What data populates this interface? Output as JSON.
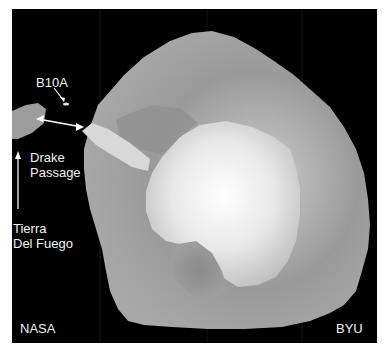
{
  "image": {
    "subject": "Satellite scatterometer image of Antarctica and surrounding sea ice",
    "colors": {
      "background": "#000000",
      "border": "#ffffff",
      "label": "#f2f2f2"
    }
  },
  "labels": {
    "iceberg": "B10A",
    "drake_line1": "Drake",
    "drake_line2": "Passage",
    "tierra_line1": "Tierra",
    "tierra_line2": "Del Fuego",
    "credit_left": "NASA",
    "credit_right": "BYU"
  },
  "annotations": [
    {
      "type": "arrow",
      "from": "B10A label",
      "to": "iceberg B10A"
    },
    {
      "type": "double-arrow",
      "between": [
        "Tierra Del Fuego",
        "Antarctic Peninsula"
      ],
      "meaning": "Drake Passage span"
    },
    {
      "type": "arrow",
      "from": "Tierra Del Fuego label",
      "direction": "up"
    }
  ]
}
